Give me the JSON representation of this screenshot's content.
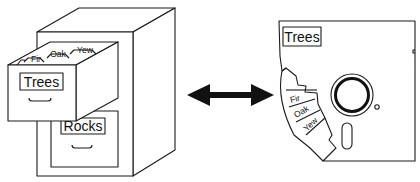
{
  "diagram": {
    "cabinet": {
      "drawers": [
        {
          "label": "Trees",
          "state": "open",
          "tabs": [
            "Fir",
            "Oak",
            "Yew"
          ]
        },
        {
          "label": "Rocks",
          "state": "closed"
        }
      ]
    },
    "connector": {
      "type": "double-arrow"
    },
    "disk": {
      "label": "Trees",
      "folders": [
        "Fir",
        "Oak",
        "Yew"
      ]
    },
    "colors": {
      "ink": "#1a1a1a",
      "background": "#ffffff"
    }
  }
}
